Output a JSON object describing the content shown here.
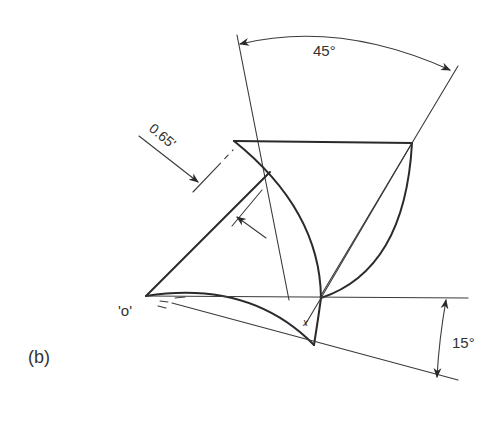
{
  "diagram": {
    "panel_label": "(b)",
    "origin_label": "'o'",
    "dimensions": {
      "top_angle": "45°",
      "side_angle": "15°",
      "offset": "0.65'"
    },
    "marker_label": "x",
    "colors": {
      "line": "#2a2a2a",
      "background": "#ffffff"
    }
  }
}
